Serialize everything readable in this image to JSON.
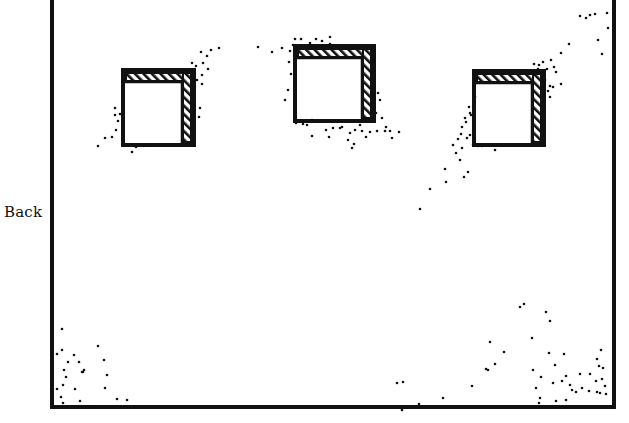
{
  "labels": {
    "side": "Back"
  },
  "colors": {
    "ink": "#111111",
    "paper": "#ffffff"
  },
  "frame": {
    "x": 52,
    "y": -4,
    "w": 562,
    "h": 411,
    "stroke": 4
  },
  "windows": [
    {
      "name": "window-left",
      "x": 123,
      "y": 70,
      "w": 71,
      "h": 75,
      "band": 11
    },
    {
      "name": "window-center",
      "x": 295,
      "y": 46,
      "w": 79,
      "h": 75,
      "band": 11
    },
    {
      "name": "window-right",
      "x": 474,
      "y": 71,
      "w": 70,
      "h": 74,
      "band": 11
    }
  ],
  "dots": [
    [
      98,
      146
    ],
    [
      105,
      138
    ],
    [
      112,
      137
    ],
    [
      116,
      130
    ],
    [
      118,
      121
    ],
    [
      115,
      115
    ],
    [
      120,
      114
    ],
    [
      115,
      108
    ],
    [
      136,
      147
    ],
    [
      146,
      145
    ],
    [
      132,
      152
    ],
    [
      192,
      71
    ],
    [
      196,
      66
    ],
    [
      203,
      63
    ],
    [
      207,
      56
    ],
    [
      208,
      69
    ],
    [
      201,
      52
    ],
    [
      211,
      50
    ],
    [
      219,
      48
    ],
    [
      197,
      80
    ],
    [
      202,
      84
    ],
    [
      200,
      108
    ],
    [
      199,
      117
    ],
    [
      192,
      63
    ],
    [
      202,
      75
    ],
    [
      258,
      47
    ],
    [
      272,
      52
    ],
    [
      282,
      48
    ],
    [
      290,
      51
    ],
    [
      293,
      45
    ],
    [
      289,
      62
    ],
    [
      291,
      74
    ],
    [
      288,
      90
    ],
    [
      285,
      100
    ],
    [
      295,
      39
    ],
    [
      301,
      39
    ],
    [
      310,
      43
    ],
    [
      316,
      39
    ],
    [
      322,
      41
    ],
    [
      330,
      44
    ],
    [
      330,
      37
    ],
    [
      378,
      93
    ],
    [
      380,
      100
    ],
    [
      376,
      113
    ],
    [
      382,
      118
    ],
    [
      386,
      127
    ],
    [
      385,
      131
    ],
    [
      377,
      131
    ],
    [
      370,
      132
    ],
    [
      366,
      137
    ],
    [
      362,
      131
    ],
    [
      355,
      130
    ],
    [
      350,
      133
    ],
    [
      348,
      140
    ],
    [
      352,
      148
    ],
    [
      354,
      144
    ],
    [
      340,
      128
    ],
    [
      333,
      128
    ],
    [
      342,
      127
    ],
    [
      326,
      130
    ],
    [
      329,
      137
    ],
    [
      312,
      136
    ],
    [
      307,
      125
    ],
    [
      296,
      123
    ],
    [
      303,
      124
    ],
    [
      312,
      120
    ],
    [
      392,
      138
    ],
    [
      399,
      132
    ],
    [
      390,
      131
    ],
    [
      360,
      125
    ],
    [
      534,
      64
    ],
    [
      539,
      65
    ],
    [
      543,
      62
    ],
    [
      538,
      69
    ],
    [
      547,
      69
    ],
    [
      551,
      60
    ],
    [
      554,
      67
    ],
    [
      553,
      87
    ],
    [
      550,
      97
    ],
    [
      561,
      84
    ],
    [
      556,
      72
    ],
    [
      542,
      74
    ],
    [
      545,
      80
    ],
    [
      550,
      86
    ],
    [
      548,
      91
    ],
    [
      561,
      53
    ],
    [
      569,
      44
    ],
    [
      608,
      28
    ],
    [
      602,
      54
    ],
    [
      598,
      40
    ],
    [
      586,
      18
    ],
    [
      590,
      15
    ],
    [
      595,
      14
    ],
    [
      607,
      13
    ],
    [
      580,
      16
    ],
    [
      475,
      97
    ],
    [
      469,
      107
    ],
    [
      471,
      115
    ],
    [
      466,
      122
    ],
    [
      462,
      127
    ],
    [
      461,
      134
    ],
    [
      470,
      135
    ],
    [
      473,
      145
    ],
    [
      467,
      138
    ],
    [
      462,
      148
    ],
    [
      456,
      153
    ],
    [
      453,
      145
    ],
    [
      460,
      160
    ],
    [
      464,
      177
    ],
    [
      468,
      172
    ],
    [
      445,
      169
    ],
    [
      446,
      182
    ],
    [
      430,
      189
    ],
    [
      420,
      209
    ],
    [
      470,
      113
    ],
    [
      465,
      118
    ],
    [
      458,
      139
    ],
    [
      478,
      146
    ],
    [
      495,
      150
    ],
    [
      482,
      146
    ],
    [
      62,
      329
    ],
    [
      57,
      354
    ],
    [
      62,
      350
    ],
    [
      64,
      370
    ],
    [
      66,
      377
    ],
    [
      68,
      362
    ],
    [
      63,
      385
    ],
    [
      57,
      389
    ],
    [
      61,
      397
    ],
    [
      63,
      403
    ],
    [
      74,
      355
    ],
    [
      79,
      362
    ],
    [
      82,
      372
    ],
    [
      84,
      370
    ],
    [
      83,
      372
    ],
    [
      98,
      346
    ],
    [
      104,
      360
    ],
    [
      107,
      375
    ],
    [
      105,
      388
    ],
    [
      92,
      407
    ],
    [
      117,
      399
    ],
    [
      127,
      400
    ],
    [
      75,
      389
    ],
    [
      80,
      401
    ],
    [
      397,
      383
    ],
    [
      403,
      382
    ],
    [
      402,
      410
    ],
    [
      419,
      404
    ],
    [
      443,
      398
    ],
    [
      472,
      386
    ],
    [
      490,
      342
    ],
    [
      486,
      369
    ],
    [
      488,
      370
    ],
    [
      495,
      364
    ],
    [
      504,
      352
    ],
    [
      520,
      307
    ],
    [
      532,
      338
    ],
    [
      533,
      370
    ],
    [
      536,
      388
    ],
    [
      539,
      403
    ],
    [
      541,
      377
    ],
    [
      546,
      312
    ],
    [
      549,
      353
    ],
    [
      550,
      321
    ],
    [
      553,
      383
    ],
    [
      555,
      365
    ],
    [
      564,
      354
    ],
    [
      566,
      400
    ],
    [
      562,
      381
    ],
    [
      566,
      376
    ],
    [
      572,
      390
    ],
    [
      576,
      392
    ],
    [
      570,
      385
    ],
    [
      580,
      374
    ],
    [
      582,
      388
    ],
    [
      589,
      391
    ],
    [
      590,
      374
    ],
    [
      596,
      381
    ],
    [
      599,
      366
    ],
    [
      597,
      359
    ],
    [
      597,
      392
    ],
    [
      601,
      350
    ],
    [
      603,
      368
    ],
    [
      605,
      386
    ],
    [
      602,
      379
    ],
    [
      600,
      393
    ],
    [
      606,
      394
    ],
    [
      524,
      304
    ],
    [
      540,
      398
    ],
    [
      556,
      401
    ]
  ]
}
